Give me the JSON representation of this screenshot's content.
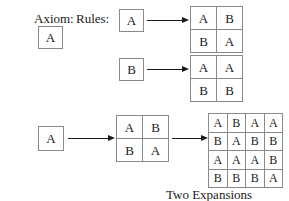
{
  "figure": {
    "caption": "Two Expansions",
    "labels": {
      "axiom": "Axiom:",
      "rules": "Rules:"
    },
    "colors": {
      "background": "#ffffff",
      "text": "#1a1a1a",
      "box_border": "#8a8a8a",
      "arrow": "#1a1a1a"
    }
  },
  "axiom": {
    "symbol": "A"
  },
  "rules": [
    {
      "lhs": "A",
      "rhs": {
        "rows": 2,
        "cols": 2,
        "cells": [
          "A",
          "B",
          "B",
          "A"
        ]
      }
    },
    {
      "lhs": "B",
      "rhs": {
        "rows": 2,
        "cols": 2,
        "cells": [
          "A",
          "A",
          "B",
          "B"
        ]
      }
    }
  ],
  "expansion": {
    "start": {
      "symbol": "A"
    },
    "step1": {
      "rows": 2,
      "cols": 2,
      "cells": [
        "A",
        "B",
        "B",
        "A"
      ]
    },
    "step2": {
      "rows": 4,
      "cols": 4,
      "cells": [
        "A",
        "B",
        "A",
        "A",
        "B",
        "A",
        "B",
        "B",
        "A",
        "A",
        "A",
        "B",
        "B",
        "B",
        "B",
        "A"
      ]
    }
  }
}
